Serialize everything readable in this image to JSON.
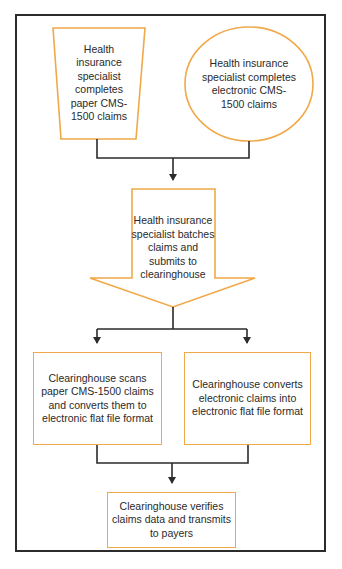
{
  "diagram": {
    "colors": {
      "shape_border": "#f0a848",
      "lines": "#2b2b2b",
      "frame": "#2b2b2b",
      "text": "#2a2a2a"
    },
    "nodes": [
      {
        "id": "paper",
        "shape": "trapezoid",
        "label": "Health insurance specialist completes paper CMS-1500 claims"
      },
      {
        "id": "electronic",
        "shape": "ellipse",
        "label": "Health insurance specialist completes electronic CMS-1500 claims"
      },
      {
        "id": "batch",
        "shape": "down-arrow",
        "label": "Health insurance specialist batches claims and submits to clearinghouse"
      },
      {
        "id": "scan",
        "shape": "rectangle",
        "label": "Clearinghouse scans paper CMS-1500 claims and converts them to electronic flat file format"
      },
      {
        "id": "convert",
        "shape": "rectangle",
        "label": "Clearinghouse converts electronic claims into electronic flat file format"
      },
      {
        "id": "verify",
        "shape": "rectangle",
        "label": "Clearinghouse verifies claims data and transmits to payers"
      }
    ],
    "edges": [
      {
        "from": "paper",
        "to": "batch"
      },
      {
        "from": "electronic",
        "to": "batch"
      },
      {
        "from": "batch",
        "to": "scan"
      },
      {
        "from": "batch",
        "to": "convert"
      },
      {
        "from": "scan",
        "to": "verify"
      },
      {
        "from": "convert",
        "to": "verify"
      }
    ]
  }
}
